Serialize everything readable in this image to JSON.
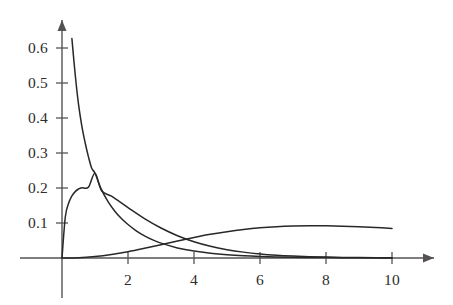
{
  "chart_data": {
    "type": "line",
    "title": "",
    "subtitle": "",
    "xlabel": "",
    "ylabel": "",
    "xlim": [
      0,
      10.6
    ],
    "ylim": [
      0,
      0.65
    ],
    "grid": false,
    "legend": false,
    "legend_position": "none",
    "axis_style": "arrow-tipped axes, no box",
    "x_ticks": [
      {
        "value": 2,
        "label": "2"
      },
      {
        "value": 4,
        "label": "4"
      },
      {
        "value": 6,
        "label": "6"
      },
      {
        "value": 8,
        "label": "8"
      },
      {
        "value": 10,
        "label": "10"
      }
    ],
    "y_ticks": [
      {
        "value": 0.1,
        "label": "0.1"
      },
      {
        "value": 0.2,
        "label": "0.2"
      },
      {
        "value": 0.3,
        "label": "0.3"
      },
      {
        "value": 0.4,
        "label": "0.4"
      },
      {
        "value": 0.5,
        "label": "0.5"
      },
      {
        "value": 0.6,
        "label": "0.6"
      }
    ],
    "series": [
      {
        "name": "curve-1-monotone-decreasing",
        "color": "#282828",
        "description": "steeply decreasing curve starting near 0.61 at left and decaying toward 0",
        "x": [
          0.3,
          0.4,
          0.5,
          0.6,
          0.7,
          0.8,
          0.9,
          1.0,
          1.2,
          1.4,
          1.6,
          1.8,
          2.0,
          2.25,
          2.5,
          2.75,
          3.0,
          3.5,
          4.0,
          4.5,
          5.0,
          5.5,
          6.0,
          6.5,
          7.0,
          7.5,
          8.0,
          8.5,
          9.0,
          9.5,
          10.0
        ],
        "y": [
          0.6268,
          0.5242,
          0.4394,
          0.3774,
          0.33,
          0.2897,
          0.2565,
          0.242,
          0.1945,
          0.1601,
          0.1338,
          0.1128,
          0.0957,
          0.0776,
          0.0633,
          0.0518,
          0.0425,
          0.0288,
          0.0197,
          0.0136,
          0.0094,
          0.0065,
          0.0045,
          0.0032,
          0.0022,
          0.0016,
          0.0011,
          0.0008,
          0.0006,
          0.0004,
          0.0003
        ]
      },
      {
        "name": "curve-2-peak-at-one",
        "color": "#282828",
        "description": "hump peaking near x = 1 at about 0.24, decaying to near 0 by x = 10",
        "x": [
          0.0,
          0.1,
          0.2,
          0.3,
          0.4,
          0.5,
          0.6,
          0.8,
          1.0,
          1.2,
          1.5,
          2.0,
          2.5,
          3.0,
          3.5,
          4.0,
          4.5,
          5.0,
          5.5,
          6.0,
          6.5,
          7.0,
          7.5,
          8.0,
          8.5,
          9.0,
          9.5,
          10.0
        ],
        "y": [
          0.0,
          0.1172,
          0.1562,
          0.1772,
          0.1897,
          0.1971,
          0.2008,
          0.2019,
          0.242,
          0.192,
          0.1765,
          0.144,
          0.1125,
          0.0856,
          0.0636,
          0.0464,
          0.0334,
          0.0238,
          0.0168,
          0.0117,
          0.0081,
          0.0056,
          0.0038,
          0.0026,
          0.0017,
          0.0012,
          0.0008,
          0.0005
        ]
      },
      {
        "name": "curve-3-broad-peak-right",
        "color": "#282828",
        "description": "broad low hump rising slowly, peaking near x = 7.5 at about 0.10, still near 0.095 at x = 10",
        "x": [
          0.0,
          0.5,
          1.0,
          1.5,
          2.0,
          2.5,
          3.0,
          3.5,
          4.0,
          4.5,
          5.0,
          5.5,
          6.0,
          6.5,
          7.0,
          7.5,
          8.0,
          8.5,
          9.0,
          9.5,
          10.0
        ],
        "y": [
          0.0,
          0.0006,
          0.004,
          0.0099,
          0.018,
          0.0277,
          0.0381,
          0.0487,
          0.0587,
          0.0677,
          0.0753,
          0.0815,
          0.0862,
          0.0894,
          0.0913,
          0.0921,
          0.0919,
          0.0909,
          0.0892,
          0.087,
          0.0845
        ]
      }
    ]
  },
  "colors": {
    "background": "#ffffff",
    "axis": "#555252",
    "curve": "#282828",
    "text": "#2e2c2c"
  }
}
